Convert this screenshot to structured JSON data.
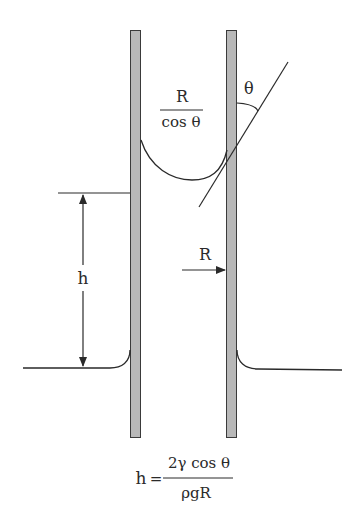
{
  "diagram": {
    "labels": {
      "theta": "θ",
      "radius_fraction_num": "R",
      "radius_fraction_den": "cos θ",
      "height": "h",
      "radius": "R"
    },
    "formula": {
      "lhs": "h",
      "equals": "=",
      "numerator": "2γ cos θ",
      "denominator": "ρgR"
    },
    "colors": {
      "tube_fill": "#b8b8b8",
      "tube_stroke": "#3a3a3a",
      "line": "#2a2a2a",
      "background": "#ffffff"
    }
  }
}
